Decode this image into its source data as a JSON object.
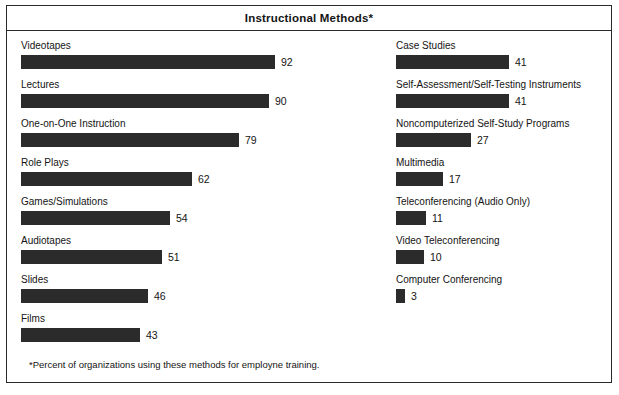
{
  "chart": {
    "title": "Instructional Methods*",
    "footnote": "*Percent of organizations using these methods for employne training."
  },
  "chart_data": {
    "type": "bar",
    "orientation": "horizontal",
    "title": "Instructional Methods*",
    "xlabel": "",
    "ylabel": "",
    "xlim": [
      0,
      100
    ],
    "grid": false,
    "legend": null,
    "annotations": [
      "*Percent of organizations using these methods for employne training."
    ],
    "value_unit": "percent",
    "layout": "two-column",
    "categories": [
      "Videotapes",
      "Lectures",
      "One-on-One Instruction",
      "Role Plays",
      "Games/Simulations",
      "Audiotapes",
      "Slides",
      "Films",
      "Case Studies",
      "Self-Assessment/Self-Testing Instruments",
      "Noncomputerized Self-Study Programs",
      "Multimedia",
      "Teleconferencing (Audio Only)",
      "Video Teleconferencing",
      "Computer Conferencing"
    ],
    "values": [
      92,
      90,
      79,
      62,
      54,
      51,
      46,
      43,
      41,
      41,
      27,
      17,
      11,
      10,
      3
    ],
    "columns": {
      "left": [
        {
          "label": "Videotapes",
          "value": 92
        },
        {
          "label": "Lectures",
          "value": 90
        },
        {
          "label": "One-on-One Instruction",
          "value": 79
        },
        {
          "label": "Role Plays",
          "value": 62
        },
        {
          "label": "Games/Simulations",
          "value": 54
        },
        {
          "label": "Audiotapes",
          "value": 51
        },
        {
          "label": "Slides",
          "value": 46
        },
        {
          "label": "Films",
          "value": 43
        }
      ],
      "right": [
        {
          "label": "Case Studies",
          "value": 41
        },
        {
          "label": "Self-Assessment/Self-Testing Instruments",
          "value": 41
        },
        {
          "label": "Noncomputerized Self-Study Programs",
          "value": 27
        },
        {
          "label": "Multimedia",
          "value": 17
        },
        {
          "label": "Teleconferencing (Audio Only)",
          "value": 11
        },
        {
          "label": "Video Teleconferencing",
          "value": 10
        },
        {
          "label": "Computer Conferencing",
          "value": 3
        }
      ]
    }
  },
  "style": {
    "bar_color": "#2b2b2b",
    "text_color": "#141414",
    "background": "#ffffff",
    "border_color": "#2a2a2a",
    "px_per_unit": 2.76
  }
}
